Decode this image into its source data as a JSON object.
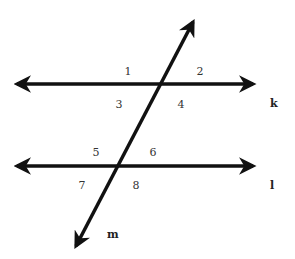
{
  "diagram": {
    "colors": {
      "line": "#111111",
      "label": "#333333",
      "background": "#ffffff"
    },
    "lines": [
      {
        "name": "k",
        "x1": 17,
        "y1": 84,
        "x2": 253,
        "y2": 84,
        "label": "k",
        "label_x": 270,
        "label_y": 107
      },
      {
        "name": "l",
        "x1": 17,
        "y1": 166,
        "x2": 253,
        "y2": 166,
        "label": "l",
        "label_x": 270,
        "label_y": 189
      },
      {
        "name": "m",
        "x1": 76,
        "y1": 246,
        "x2": 193,
        "y2": 22,
        "label": "m",
        "label_x": 107,
        "label_y": 238
      }
    ],
    "angles": [
      {
        "label": "1",
        "x": 128,
        "y": 75
      },
      {
        "label": "2",
        "x": 200,
        "y": 75
      },
      {
        "label": "3",
        "x": 119,
        "y": 108
      },
      {
        "label": "4",
        "x": 181,
        "y": 108
      },
      {
        "label": "5",
        "x": 96,
        "y": 156
      },
      {
        "label": "6",
        "x": 153,
        "y": 156
      },
      {
        "label": "7",
        "x": 82,
        "y": 189
      },
      {
        "label": "8",
        "x": 136,
        "y": 189
      }
    ]
  }
}
